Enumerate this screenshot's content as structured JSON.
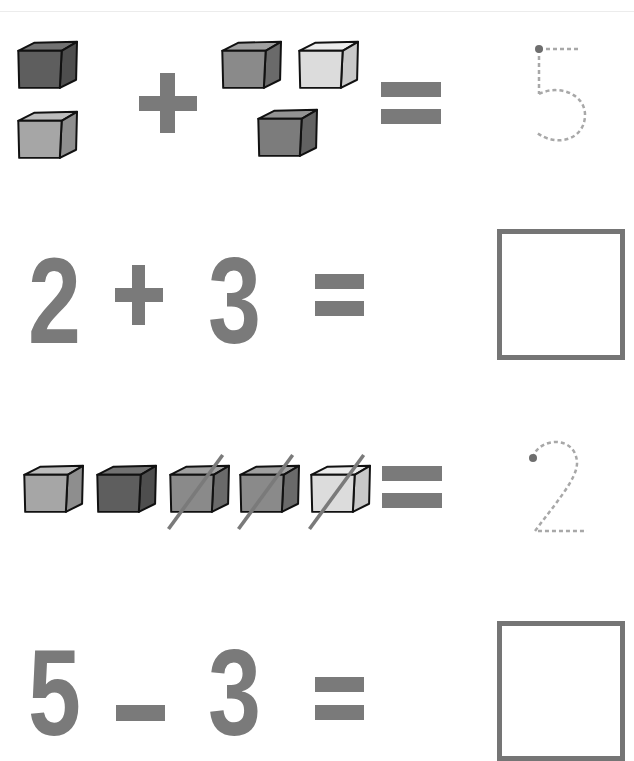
{
  "worksheet": {
    "colors": {
      "symbol_gray": "#7a7a7a",
      "trace_gray": "#a8a8a8",
      "dot_gray": "#6e6e6e",
      "box_border": "#757575",
      "cube_outline": "#111111"
    },
    "row1": {
      "type": "picture-addition",
      "left_group": [
        {
          "shade": "dark",
          "front": "#5e5e5e",
          "top": "#727272",
          "side": "#4e4e4e"
        },
        {
          "shade": "light",
          "front": "#a6a6a6",
          "top": "#bdbdbd",
          "side": "#8e8e8e"
        }
      ],
      "operator": "+",
      "right_group": [
        {
          "shade": "medium",
          "front": "#8a8a8a",
          "top": "#a0a0a0",
          "side": "#6a6a6a"
        },
        {
          "shade": "pale",
          "front": "#dcdcdc",
          "top": "#ececec",
          "side": "#c8c8c8"
        },
        {
          "shade": "medium-dark",
          "front": "#7c7c7c",
          "top": "#939393",
          "side": "#626262"
        }
      ],
      "equals": "=",
      "trace_digit": "5"
    },
    "row2": {
      "type": "number-addition",
      "left": "2",
      "operator": "+",
      "right": "3",
      "equals": "=",
      "answer": ""
    },
    "row3": {
      "type": "picture-subtraction",
      "cubes": [
        {
          "shade": "light",
          "front": "#a6a6a6",
          "top": "#bdbdbd",
          "side": "#8e8e8e",
          "crossed": false
        },
        {
          "shade": "dark",
          "front": "#5e5e5e",
          "top": "#727272",
          "side": "#4e4e4e",
          "crossed": false
        },
        {
          "shade": "medium",
          "front": "#8a8a8a",
          "top": "#a0a0a0",
          "side": "#6a6a6a",
          "crossed": true
        },
        {
          "shade": "medium",
          "front": "#8a8a8a",
          "top": "#a0a0a0",
          "side": "#6a6a6a",
          "crossed": true
        },
        {
          "shade": "pale",
          "front": "#dcdcdc",
          "top": "#ececec",
          "side": "#c8c8c8",
          "crossed": true
        }
      ],
      "equals": "=",
      "trace_digit": "2"
    },
    "row4": {
      "type": "number-subtraction",
      "left": "5",
      "operator": "–",
      "right": "3",
      "equals": "=",
      "answer": ""
    }
  }
}
